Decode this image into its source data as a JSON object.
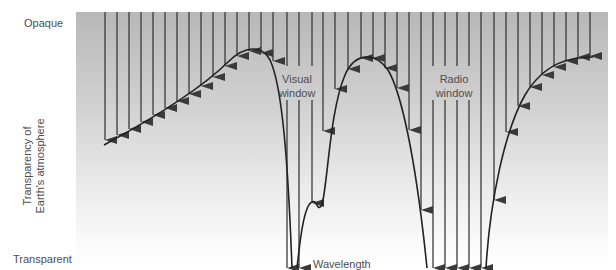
{
  "diagram": {
    "y_axis": {
      "label_line1": "Transparency of",
      "label_line2": "Earth's atmosphere",
      "top_label": "Opaque",
      "bottom_label": "Transparent"
    },
    "x_axis": {
      "label": "Wavelength"
    },
    "windows": [
      {
        "line1": "Visual",
        "line2": "window"
      },
      {
        "line1": "Radio",
        "line2": "window"
      }
    ],
    "colors": {
      "panel_top": "#b8b8b8",
      "panel_bottom": "#ffffff",
      "arrow": "#3a3a3a",
      "curve": "#222222"
    },
    "panel": {
      "x": 76,
      "y": 12,
      "width": 532,
      "height": 250
    },
    "arrow_top_y": 12,
    "arrows": [
      {
        "x": 105,
        "tip": 140
      },
      {
        "x": 117,
        "tip": 135
      },
      {
        "x": 129,
        "tip": 129
      },
      {
        "x": 141,
        "tip": 122
      },
      {
        "x": 153,
        "tip": 115
      },
      {
        "x": 165,
        "tip": 108
      },
      {
        "x": 177,
        "tip": 101
      },
      {
        "x": 189,
        "tip": 94
      },
      {
        "x": 201,
        "tip": 86
      },
      {
        "x": 213,
        "tip": 77
      },
      {
        "x": 225,
        "tip": 66
      },
      {
        "x": 237,
        "tip": 56
      },
      {
        "x": 249,
        "tip": 51
      },
      {
        "x": 261,
        "tip": 53
      },
      {
        "x": 273,
        "tip": 61
      },
      {
        "x": 275,
        "tip": 90
      },
      {
        "x": 287,
        "tip": 268
      },
      {
        "x": 299,
        "tip": 268
      },
      {
        "x": 312,
        "tip": 203
      },
      {
        "x": 323,
        "tip": 131
      },
      {
        "x": 335,
        "tip": 89
      },
      {
        "x": 348,
        "tip": 69
      },
      {
        "x": 361,
        "tip": 58
      },
      {
        "x": 373,
        "tip": 58
      },
      {
        "x": 385,
        "tip": 68
      },
      {
        "x": 397,
        "tip": 88
      },
      {
        "x": 409,
        "tip": 130
      },
      {
        "x": 421,
        "tip": 210
      },
      {
        "x": 433,
        "tip": 268
      },
      {
        "x": 445,
        "tip": 268
      },
      {
        "x": 457,
        "tip": 268
      },
      {
        "x": 469,
        "tip": 268
      },
      {
        "x": 481,
        "tip": 268
      },
      {
        "x": 494,
        "tip": 200
      },
      {
        "x": 506,
        "tip": 132
      },
      {
        "x": 518,
        "tip": 106
      },
      {
        "x": 530,
        "tip": 87
      },
      {
        "x": 542,
        "tip": 75
      },
      {
        "x": 554,
        "tip": 67
      },
      {
        "x": 566,
        "tip": 61
      },
      {
        "x": 578,
        "tip": 57
      },
      {
        "x": 590,
        "tip": 56
      }
    ],
    "visual_window_gap": {
      "from_y": 66,
      "to_y": 100,
      "x_range": [
        286,
        313
      ]
    },
    "radio_window_gap": {
      "from_y": 66,
      "to_y": 100,
      "x_range": [
        432,
        471
      ]
    },
    "curves": [
      "M104,145 C150,120 200,90 228,62 C245,45 262,45 270,60 C282,85 288,160 292,268",
      "M297,268 C300,240 304,205 312,202 C318,199 316,213 322,205 C328,180 330,110 345,75 C355,52 375,52 388,70 C400,90 415,150 427,268",
      "M486,268 C490,200 505,130 525,95 C545,62 570,57 593,57"
    ]
  }
}
